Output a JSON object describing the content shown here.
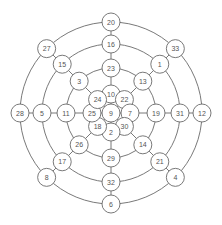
{
  "diagram": {
    "type": "radial-concentric-graph",
    "center": {
      "x": 111,
      "y": 113
    },
    "rings": [
      {
        "name": "ring-1",
        "radius": 19,
        "nodes": [
          "10",
          "22",
          "7",
          "30",
          "2",
          "18",
          "25",
          "24"
        ]
      },
      {
        "name": "ring-2",
        "radius": 45,
        "nodes": [
          "23",
          "13",
          "19",
          "14",
          "29",
          "26",
          "11",
          "3"
        ]
      },
      {
        "name": "ring-3",
        "radius": 69,
        "nodes": [
          "16",
          "1",
          "31",
          "21",
          "32",
          "17",
          "5",
          "15"
        ]
      },
      {
        "name": "ring-4",
        "radius": 91,
        "nodes": [
          "20",
          "33",
          "12",
          "4",
          "6",
          "8",
          "28",
          "27"
        ]
      }
    ],
    "center_node": "9",
    "node_radius": 9,
    "colors": {
      "stroke": "#6a6a6a",
      "text": "#555555",
      "fill": "#ffffff"
    }
  }
}
